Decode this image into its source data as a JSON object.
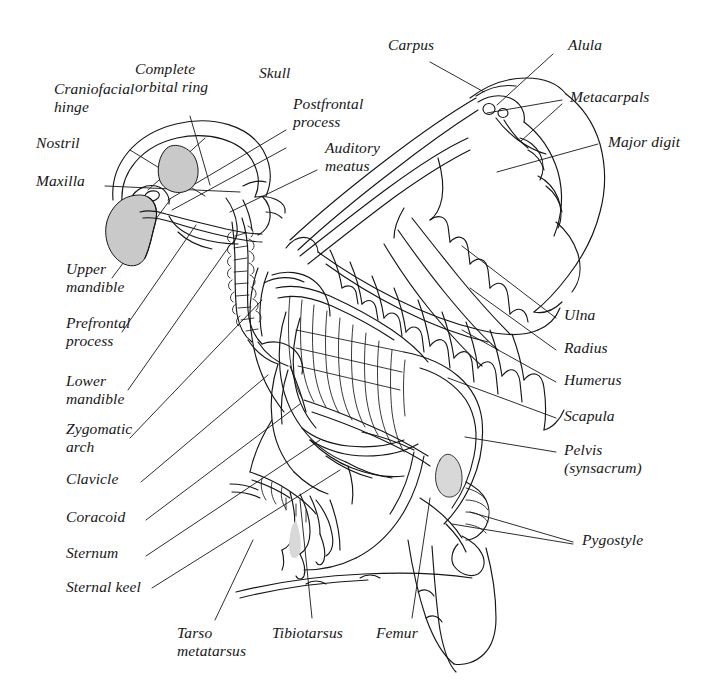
{
  "diagram": {
    "style": "pen-and-ink line drawing with leader lines",
    "background_color": "#ffffff",
    "ink_color": "#161616",
    "shading_color": "#c9c9c9"
  },
  "labels": {
    "craniofacial_hinge": "Craniofacial\nhinge",
    "complete_orbital_ring": "Complete\norbital ring",
    "skull": "Skull",
    "postfrontal_process": "Postfrontal\nprocess",
    "auditory_meatus": "Auditory\nmeatus",
    "nostril": "Nostril",
    "maxilla": "Maxilla",
    "upper_mandible": "Upper\nmandible",
    "prefrontal_process": "Prefrontal\nprocess",
    "lower_mandible": "Lower\nmandible",
    "zygomatic_arch": "Zygomatic\narch",
    "clavicle": "Clavicle",
    "coracoid": "Coracoid",
    "sternum": "Sternum",
    "sternal_keel": "Sternal keel",
    "carpus": "Carpus",
    "alula": "Alula",
    "metacarpals": "Metacarpals",
    "major_digit": "Major digit",
    "ulna": "Ulna",
    "radius": "Radius",
    "humerus": "Humerus",
    "scapula": "Scapula",
    "pelvis": "Pelvis\n(synsacrum)",
    "pygostyle": "Pygostyle",
    "tarso_metatarsus": "Tarso\nmetatarsus",
    "tibiotarsus": "Tibiotarsus",
    "femur": "Femur"
  }
}
